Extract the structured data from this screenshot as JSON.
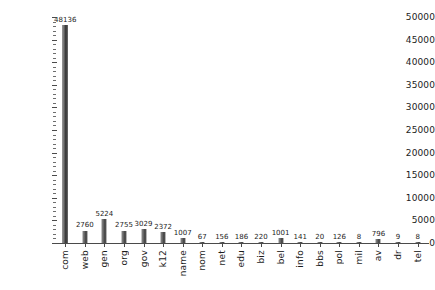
{
  "chart_data": {
    "type": "bar",
    "title": "",
    "subtitle": "",
    "xlabel": "",
    "ylabel": "",
    "ylim": [
      0,
      50000
    ],
    "y_major_step": 5000,
    "y_minor_step": 1000,
    "grid": false,
    "legend": "none",
    "orientation": "vertical",
    "categories": [
      "com",
      "web",
      "gen",
      "org",
      "gov",
      "k12",
      "name",
      "nom",
      "net",
      "edu",
      "biz",
      "bel",
      "info",
      "bbs",
      "pol",
      "mil",
      "av",
      "dr",
      "tel"
    ],
    "values": [
      48136,
      2760,
      5224,
      2755,
      3029,
      2372,
      1007,
      67,
      156,
      186,
      220,
      1001,
      141,
      20,
      126,
      8,
      796,
      9,
      8
    ],
    "value_labels": [
      "48136",
      "2760",
      "5224",
      "2755",
      "3029",
      "2372",
      "1007",
      "67",
      "156",
      "186",
      "220",
      "1001",
      "141",
      "20",
      "126",
      "8",
      "796",
      "9",
      "8"
    ],
    "ytick_labels": [
      "0",
      "5000",
      "10000",
      "15000",
      "20000",
      "25000",
      "30000",
      "35000",
      "40000",
      "45000",
      "50000"
    ],
    "ytick_values": [
      0,
      5000,
      10000,
      15000,
      20000,
      25000,
      30000,
      35000,
      40000,
      45000,
      50000
    ],
    "bar_color": "#4a4a4a",
    "axis_color": "#4a4a4a",
    "text_color": "#1c1c1c",
    "background": "#ffffff"
  }
}
